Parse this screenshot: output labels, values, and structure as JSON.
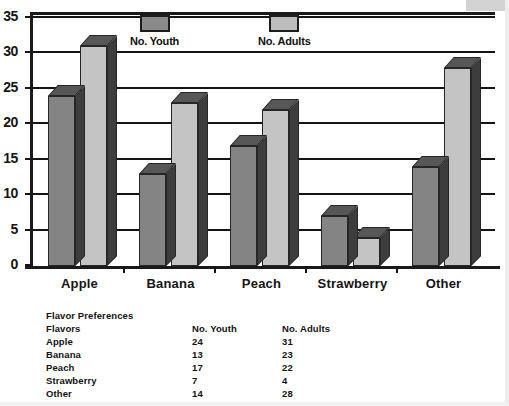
{
  "chart_data": {
    "type": "bar",
    "title": "",
    "xlabel": "",
    "ylabel": "",
    "ylim": [
      0,
      35
    ],
    "ytick_values": [
      0,
      5,
      10,
      15,
      20,
      25,
      30,
      35
    ],
    "ytick_labels": [
      "0",
      "5",
      "10",
      "15",
      "20",
      "25",
      "30",
      "35"
    ],
    "grid": true,
    "legend_position": "top-inside",
    "style": "3d-grouped-bars",
    "categories": [
      "Apple",
      "Banana",
      "Peach",
      "Strawberry",
      "Other"
    ],
    "series": [
      {
        "name": "No. Youth",
        "color": "#848484",
        "values": [
          24,
          13,
          17,
          7,
          14
        ]
      },
      {
        "name": "No. Adults",
        "color": "#c4c4c4",
        "values": [
          31,
          23,
          22,
          4,
          28
        ]
      }
    ]
  },
  "legend": {
    "items": [
      {
        "label": "No. Youth",
        "swatch": "youth"
      },
      {
        "label": "No. Adults",
        "swatch": "adults"
      }
    ]
  },
  "table": {
    "title": "Flavor Preferences",
    "headers": [
      "Flavors",
      "No. Youth",
      "No. Adults"
    ],
    "rows": [
      {
        "flavor": "Apple",
        "youth": "24",
        "adults": "31"
      },
      {
        "flavor": "Banana",
        "youth": "13",
        "adults": "23"
      },
      {
        "flavor": "Peach",
        "youth": "17",
        "adults": "22"
      },
      {
        "flavor": "Strawberry",
        "youth": "7",
        "adults": "4"
      },
      {
        "flavor": "Other",
        "youth": "14",
        "adults": "28"
      }
    ]
  },
  "colors": {
    "youth_bar": "#848484",
    "adults_bar": "#c4c4c4",
    "bar_side": "#3d3d3d",
    "bar_top": "#575757",
    "axis": "#141414",
    "background": "#ffffff"
  }
}
